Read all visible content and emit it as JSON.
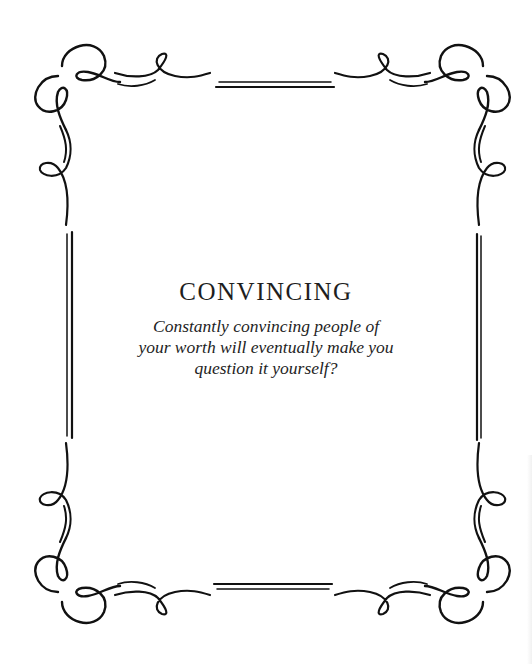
{
  "card": {
    "title": "CONVINCING",
    "quote_lines": [
      "Constantly convincing people of",
      "your worth will eventually make you",
      "question it yourself?"
    ]
  },
  "frame": {
    "style": "ornamental-flourish-border",
    "stroke_color": "#111111",
    "background": "#ffffff"
  }
}
